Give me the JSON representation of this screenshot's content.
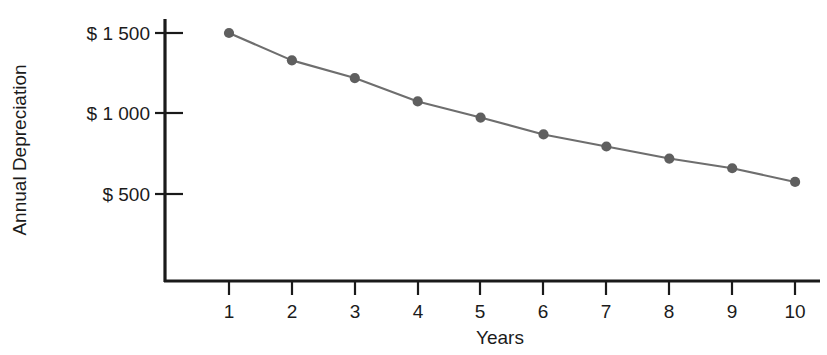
{
  "chart_data": {
    "type": "line",
    "title": "",
    "xlabel": "Years",
    "ylabel": "Annual Depreciation",
    "x": [
      1,
      2,
      3,
      4,
      5,
      6,
      7,
      8,
      9,
      10
    ],
    "values": [
      1500,
      1330,
      1220,
      1075,
      975,
      870,
      795,
      720,
      660,
      575
    ],
    "series": [
      {
        "name": "Annual Depreciation",
        "values": [
          1500,
          1330,
          1220,
          1075,
          975,
          870,
          795,
          720,
          660,
          575
        ]
      }
    ],
    "x_tick_labels": [
      "1",
      "2",
      "3",
      "4",
      "5",
      "6",
      "7",
      "8",
      "9",
      "10"
    ],
    "y_tick_labels": [
      "$ 500",
      "$ 1 000",
      "$ 1 500"
    ],
    "y_tick_values": [
      500,
      1000,
      1500
    ],
    "xlim": [
      0.6,
      10.4
    ],
    "ylim": [
      0,
      1600
    ],
    "grid": false,
    "legend": false,
    "marker_color": "#5f5f5f",
    "line_color": "#6e6e6e",
    "axis_color": "#1a1a1a"
  },
  "axes": {
    "y_axis_title": "Annual Depreciation",
    "x_axis_title": "Years"
  }
}
